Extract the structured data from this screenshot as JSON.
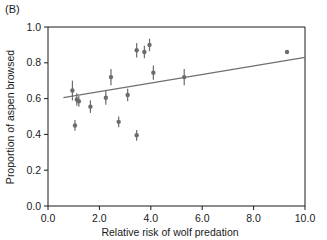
{
  "panel": {
    "label": "(B)"
  },
  "chart_data": {
    "type": "scatter",
    "title": "",
    "panel_label": "(B)",
    "xlabel": "Relative risk of wolf predation",
    "ylabel": "Proportion of aspen browsed",
    "xlim": [
      0.0,
      10.0
    ],
    "ylim": [
      0.0,
      1.0
    ],
    "xticks": [
      0.0,
      2.0,
      4.0,
      6.0,
      8.0,
      10.0
    ],
    "xtick_labels": [
      "0.0",
      "2.0",
      "4.0",
      "6.0",
      "8.0",
      "10.0"
    ],
    "yticks": [
      0.0,
      0.2,
      0.4,
      0.6,
      0.8,
      1.0
    ],
    "ytick_labels": [
      "0.0",
      "0.2",
      "0.4",
      "0.6",
      "0.8",
      "1.0"
    ],
    "grid": false,
    "legend": false,
    "marker_color": "#6b6b6b",
    "line_color": "#707070",
    "axis_color": "#1a1a1a",
    "errorbars": true,
    "points": [
      {
        "x": 0.95,
        "y": 0.645,
        "yerr": 0.055
      },
      {
        "x": 1.12,
        "y": 0.595,
        "yerr": 0.035
      },
      {
        "x": 1.2,
        "y": 0.585,
        "yerr": 0.03
      },
      {
        "x": 1.05,
        "y": 0.45,
        "yerr": 0.03
      },
      {
        "x": 1.65,
        "y": 0.555,
        "yerr": 0.035
      },
      {
        "x": 2.25,
        "y": 0.605,
        "yerr": 0.04
      },
      {
        "x": 2.45,
        "y": 0.72,
        "yerr": 0.045
      },
      {
        "x": 2.75,
        "y": 0.47,
        "yerr": 0.03
      },
      {
        "x": 3.1,
        "y": 0.62,
        "yerr": 0.035
      },
      {
        "x": 3.45,
        "y": 0.395,
        "yerr": 0.03
      },
      {
        "x": 3.45,
        "y": 0.87,
        "yerr": 0.04
      },
      {
        "x": 3.75,
        "y": 0.86,
        "yerr": 0.035
      },
      {
        "x": 3.95,
        "y": 0.9,
        "yerr": 0.035
      },
      {
        "x": 4.1,
        "y": 0.745,
        "yerr": 0.04
      },
      {
        "x": 5.3,
        "y": 0.72,
        "yerr": 0.045
      },
      {
        "x": 9.3,
        "y": 0.86,
        "yerr": 0.0
      }
    ],
    "fit_line": {
      "x_start": 0.6,
      "y_start": 0.605,
      "x_end": 10.2,
      "y_end": 0.835
    }
  }
}
